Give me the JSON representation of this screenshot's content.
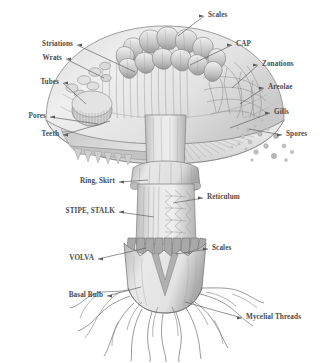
{
  "diagram": {
    "background_color": "#ffffff",
    "label_color": "#4b4b4b",
    "leader_line_color": "#5a5a5a",
    "ink_color": "#6e6e6e"
  },
  "labels": {
    "scales_cap": "Scales",
    "cap": "CAP",
    "zonations": "Zonations",
    "areolae": "Areolae",
    "gills": "Gills",
    "spores": "Spores",
    "striations": "Striations",
    "wrats": "Wrats",
    "tubes": "Tubes",
    "pores": "Pores",
    "teeth": "Teeth",
    "ring_skirt": "Ring, Skirt",
    "reticulum": "Reticulum",
    "stipe_stalk": "STIPE, STALK",
    "scales_stem": "Scales",
    "volva": "VOLVA",
    "basal_bulb": "Basal Bulb",
    "mycelial_threads": "Mycelial Threads"
  }
}
